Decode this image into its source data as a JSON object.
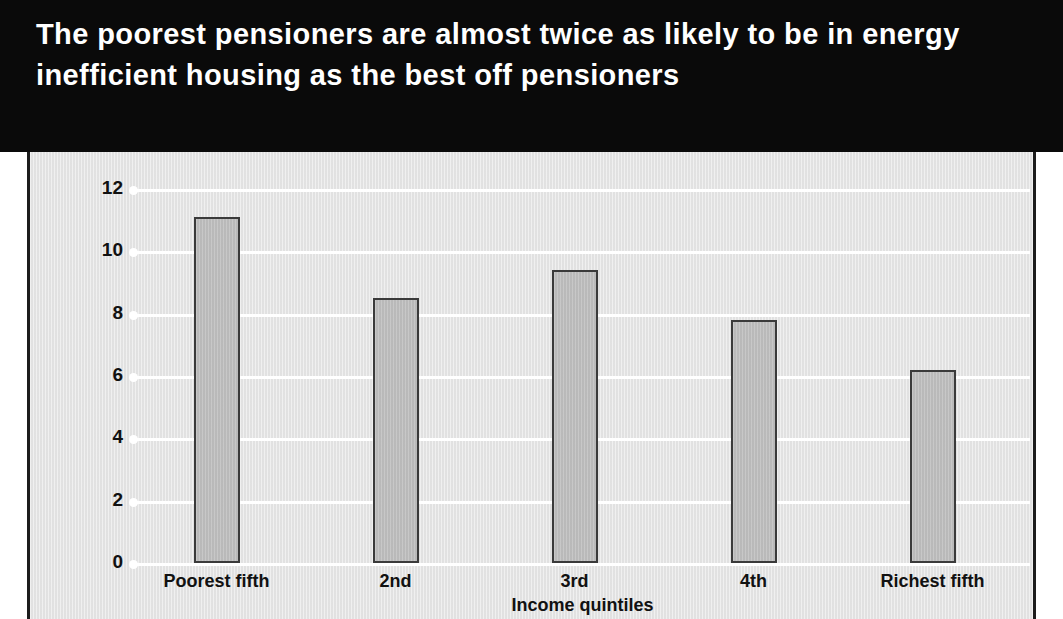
{
  "figure": {
    "title": "The poorest pensioners are almost twice as likely to be in energy inefficient housing as the best off pensioners",
    "title_color": "#ffffff",
    "title_background": "#0a0a0a",
    "panel_background": "#e4e4e4",
    "bar_fill": "#bdbdbd",
    "bar_outline": "#3a3a3a",
    "gridline_color": "#ffffff"
  },
  "chart_data": {
    "type": "bar",
    "title": "The poorest pensioners are almost twice as likely to be in energy inefficient housing as the best off pensioners",
    "xlabel": "Income quintiles",
    "ylabel": "Homes which are energy inefficient (per cent)",
    "categories": [
      "Poorest fifth",
      "2nd",
      "3rd",
      "4th",
      "Richest fifth"
    ],
    "values": [
      11.1,
      8.5,
      9.4,
      7.8,
      6.2
    ],
    "ylim": [
      0,
      12
    ],
    "yticks": [
      0,
      2,
      4,
      6,
      8,
      10,
      12
    ],
    "ytick_labels": [
      "0",
      "2",
      "4",
      "6",
      "8",
      "10",
      "12"
    ],
    "grid": true,
    "grid_axis": "y",
    "legend": false
  }
}
